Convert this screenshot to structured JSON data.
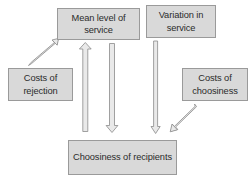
{
  "diagram": {
    "type": "flow-diagram",
    "background_color": "#ffffff",
    "node_fill_color": "#d9d9d9",
    "node_border_color": "#9a9a9a",
    "arrow_color": "#8a8a8a",
    "text_color": "#2b2b2b",
    "nodes": [
      {
        "id": "mean-level",
        "label": "Mean level of service",
        "line1": "Mean level of",
        "line2": "service",
        "position": "top-center"
      },
      {
        "id": "variation",
        "label": "Variation in service",
        "line1": "Variation in",
        "line2": "service",
        "position": "top-right"
      },
      {
        "id": "costs-rejection",
        "label": "Costs of rejection",
        "line1": "Costs of",
        "line2": "rejection",
        "position": "middle-left"
      },
      {
        "id": "costs-choosiness",
        "label": "Costs of choosiness",
        "line1": "Costs of",
        "line2": "choosiness",
        "position": "middle-right"
      },
      {
        "id": "choosiness",
        "label": "Choosiness of recipients",
        "line1": "Choosiness of",
        "line2": "recipients",
        "position": "bottom-center"
      }
    ],
    "arrows": [
      {
        "id": "arrow-rejection-to-mean",
        "from": "costs-rejection",
        "to": "mean-level",
        "direction": "diagonal-up-right"
      },
      {
        "id": "arrow-choosiness-to-mean",
        "from": "choosiness",
        "to": "mean-level",
        "direction": "up"
      },
      {
        "id": "arrow-mean-to-choosiness",
        "from": "mean-level",
        "to": "choosiness",
        "direction": "down"
      },
      {
        "id": "arrow-variation-to-choosiness",
        "from": "variation",
        "to": "choosiness",
        "direction": "down"
      },
      {
        "id": "arrow-costschoosiness-to-choosiness",
        "from": "costs-choosiness",
        "to": "choosiness",
        "direction": "diagonal-down-left"
      }
    ]
  }
}
